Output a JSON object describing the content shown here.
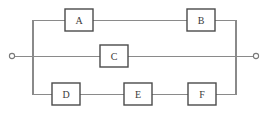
{
  "diagram": {
    "type": "reliability-block-diagram",
    "title": "",
    "background_color": "#ffffff",
    "wire_color": "#8a8a8a",
    "box_stroke_color": "#4a4a4a",
    "box_fill_color": "#ffffff",
    "label_color": "#3a3a3a",
    "terminals": [
      {
        "id": "input-terminal",
        "name": "input-terminal",
        "label": "",
        "cx": 12,
        "cy": 56,
        "r": 2.6
      },
      {
        "id": "output-terminal",
        "name": "output-terminal",
        "label": "",
        "cx": 256,
        "cy": 56,
        "r": 2.6
      }
    ],
    "branches": [
      {
        "id": "top-branch",
        "label": "",
        "y": 20,
        "components": [
          "A",
          "B"
        ]
      },
      {
        "id": "middle-branch",
        "label": "",
        "y": 56,
        "components": [
          "C"
        ]
      },
      {
        "id": "bottom-branch",
        "label": "",
        "y": 94,
        "components": [
          "D",
          "E",
          "F"
        ]
      }
    ],
    "components": [
      {
        "id": "A",
        "label": "A",
        "x": 65,
        "y": 9,
        "w": 28,
        "h": 22,
        "branch": "top-branch"
      },
      {
        "id": "B",
        "label": "B",
        "x": 187,
        "y": 9,
        "w": 28,
        "h": 22,
        "branch": "top-branch"
      },
      {
        "id": "C",
        "label": "C",
        "x": 100,
        "y": 45,
        "w": 28,
        "h": 22,
        "branch": "middle-branch"
      },
      {
        "id": "D",
        "label": "D",
        "x": 52,
        "y": 83,
        "w": 28,
        "h": 22,
        "branch": "bottom-branch"
      },
      {
        "id": "E",
        "label": "E",
        "x": 124,
        "y": 83,
        "w": 28,
        "h": 22,
        "branch": "bottom-branch"
      },
      {
        "id": "F",
        "label": "F",
        "x": 188,
        "y": 83,
        "w": 28,
        "h": 22,
        "branch": "bottom-branch"
      }
    ],
    "rails": [
      {
        "id": "left-rail",
        "name": "left-vertical-rail",
        "x": 33,
        "y1": 20,
        "y2": 94
      },
      {
        "id": "right-rail",
        "name": "right-vertical-rail",
        "x": 236,
        "y1": 20,
        "y2": 94
      }
    ],
    "wire_segments": [
      {
        "id": "input-lead",
        "name": "input-lead-wire",
        "x1": 14,
        "y1": 56,
        "x2": 33,
        "y2": 56
      },
      {
        "id": "mid-left",
        "name": "middle-branch-left-wire",
        "x1": 33,
        "y1": 56,
        "x2": 100,
        "y2": 56
      },
      {
        "id": "mid-right",
        "name": "middle-branch-right-wire",
        "x1": 128,
        "y1": 56,
        "x2": 236,
        "y2": 56
      },
      {
        "id": "output-lead",
        "name": "output-lead-wire",
        "x1": 236,
        "y1": 56,
        "x2": 254,
        "y2": 56
      },
      {
        "id": "top-left",
        "name": "top-branch-left-wire",
        "x1": 33,
        "y1": 20,
        "x2": 65,
        "y2": 20
      },
      {
        "id": "top-mid",
        "name": "top-branch-middle-wire",
        "x1": 93,
        "y1": 20,
        "x2": 187,
        "y2": 20
      },
      {
        "id": "top-right",
        "name": "top-branch-right-wire",
        "x1": 215,
        "y1": 20,
        "x2": 236,
        "y2": 20
      },
      {
        "id": "bot-left",
        "name": "bottom-branch-left-wire",
        "x1": 33,
        "y1": 94,
        "x2": 52,
        "y2": 94
      },
      {
        "id": "bot-mid1",
        "name": "bottom-branch-wire-d-e",
        "x1": 80,
        "y1": 94,
        "x2": 124,
        "y2": 94
      },
      {
        "id": "bot-mid2",
        "name": "bottom-branch-wire-e-f",
        "x1": 152,
        "y1": 94,
        "x2": 188,
        "y2": 94
      },
      {
        "id": "bot-right",
        "name": "bottom-branch-right-wire",
        "x1": 216,
        "y1": 94,
        "x2": 236,
        "y2": 94
      }
    ]
  }
}
